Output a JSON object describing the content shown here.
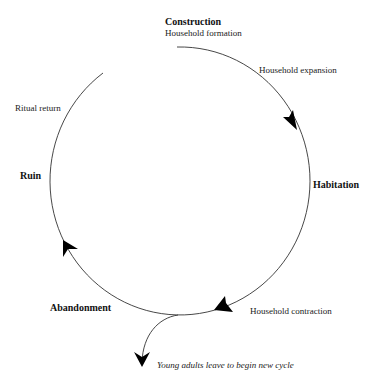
{
  "diagram": {
    "type": "cycle",
    "stages": [
      {
        "id": "construction",
        "label": "Construction",
        "sublabel": "Household formation"
      },
      {
        "id": "habitation",
        "label": "Habitation"
      },
      {
        "id": "abandonment",
        "label": "Abandonment"
      },
      {
        "id": "ruin",
        "label": "Ruin"
      }
    ],
    "transitions": [
      {
        "label": "Household expansion"
      },
      {
        "label": "Household contraction"
      },
      {
        "label": "Ritual return"
      }
    ],
    "branch": {
      "label": "Young adults leave to begin new cycle"
    },
    "colors": {
      "line": "#333333",
      "arrow": "#000000",
      "text": "#111111"
    }
  }
}
